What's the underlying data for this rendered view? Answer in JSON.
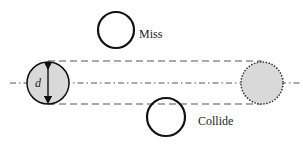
{
  "diagram": {
    "labels": {
      "miss": "Miss",
      "collide": "Collide",
      "diameter": "d"
    },
    "colors": {
      "particle_fill": "#d9d9d9",
      "stroke": "#111111",
      "line": "#555555",
      "background": "#ffffff"
    }
  }
}
